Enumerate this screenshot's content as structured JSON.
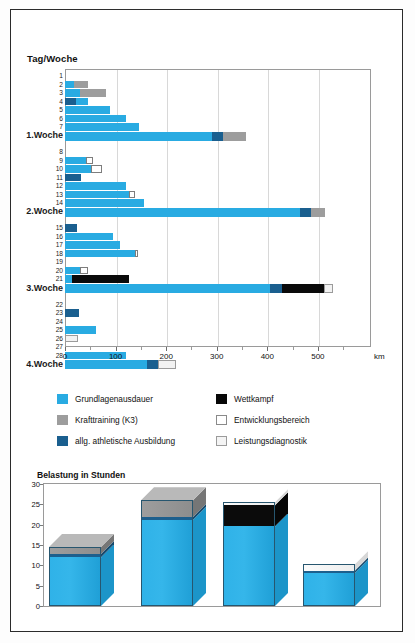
{
  "frame": {
    "border_color": "#2b2b2b"
  },
  "top_chart": {
    "title": "Tag/Woche",
    "unit_label": "km",
    "x_axis": {
      "min": 0,
      "max": 605,
      "ticks": [
        0,
        100,
        200,
        300,
        400,
        500
      ],
      "tick_labels": [
        "0",
        "100",
        "200",
        "300",
        "400",
        "500"
      ]
    },
    "colors": {
      "grundlagenausdauer": "#29abe2",
      "krafttraining": "#9d9d9d",
      "athletische_ausbildung": "#1a5f8f",
      "wettkampf": "#0a0a0a",
      "entwicklungsbereich": "#ffffff",
      "leistungsdiagnostik": "#f2f2f2"
    },
    "rows": [
      {
        "label": "1",
        "type": "day",
        "segments": []
      },
      {
        "label": "2",
        "type": "day",
        "segments": [
          {
            "k": "gla",
            "v": 18
          },
          {
            "k": "kraft",
            "v": 27
          }
        ]
      },
      {
        "label": "3",
        "type": "day",
        "segments": [
          {
            "k": "gla",
            "v": 30
          },
          {
            "k": "kraft",
            "v": 52
          }
        ]
      },
      {
        "label": "4",
        "type": "day",
        "segments": [
          {
            "k": "ath",
            "v": 22
          },
          {
            "k": "gla",
            "v": 24
          }
        ]
      },
      {
        "label": "5",
        "type": "day",
        "segments": [
          {
            "k": "gla",
            "v": 88
          }
        ]
      },
      {
        "label": "6",
        "type": "day",
        "segments": [
          {
            "k": "gla",
            "v": 120
          }
        ]
      },
      {
        "label": "7",
        "type": "day",
        "segments": [
          {
            "k": "gla",
            "v": 146
          }
        ]
      },
      {
        "label": "1.Woche",
        "type": "week",
        "segments": [
          {
            "k": "gla",
            "v": 290
          },
          {
            "k": "ath",
            "v": 22
          },
          {
            "k": "kraft",
            "v": 45
          }
        ]
      },
      {
        "label": "8",
        "type": "day",
        "segments": []
      },
      {
        "label": "9",
        "type": "day",
        "segments": [
          {
            "k": "gla",
            "v": 42
          },
          {
            "k": "entw",
            "v": 14
          }
        ]
      },
      {
        "label": "10",
        "type": "day",
        "segments": [
          {
            "k": "gla",
            "v": 52
          },
          {
            "k": "entw",
            "v": 22
          }
        ]
      },
      {
        "label": "11",
        "type": "day",
        "segments": [
          {
            "k": "ath",
            "v": 32
          }
        ]
      },
      {
        "label": "12",
        "type": "day",
        "segments": [
          {
            "k": "gla",
            "v": 120
          }
        ]
      },
      {
        "label": "13",
        "type": "day",
        "segments": [
          {
            "k": "gla",
            "v": 126
          },
          {
            "k": "entw",
            "v": 12
          }
        ]
      },
      {
        "label": "14",
        "type": "day",
        "segments": [
          {
            "k": "gla",
            "v": 157
          }
        ]
      },
      {
        "label": "2.Woche",
        "type": "week",
        "segments": [
          {
            "k": "gla",
            "v": 465
          },
          {
            "k": "ath",
            "v": 22
          },
          {
            "k": "kraft",
            "v": 27
          }
        ]
      },
      {
        "label": "15",
        "type": "day",
        "segments": [
          {
            "k": "ath",
            "v": 23
          }
        ]
      },
      {
        "label": "16",
        "type": "day",
        "segments": [
          {
            "k": "gla",
            "v": 95
          }
        ]
      },
      {
        "label": "17",
        "type": "day",
        "segments": [
          {
            "k": "gla",
            "v": 108
          }
        ]
      },
      {
        "label": "18",
        "type": "day",
        "segments": [
          {
            "k": "gla",
            "v": 138
          },
          {
            "k": "entw",
            "v": 7
          }
        ]
      },
      {
        "label": "19",
        "type": "day",
        "segments": []
      },
      {
        "label": "20",
        "type": "day",
        "segments": [
          {
            "k": "gla",
            "v": 30
          },
          {
            "k": "entw",
            "v": 16
          }
        ]
      },
      {
        "label": "21",
        "type": "day",
        "segments": [
          {
            "k": "gla",
            "v": 14
          },
          {
            "k": "wett",
            "v": 112
          }
        ]
      },
      {
        "label": "3.Woche",
        "type": "week",
        "segments": [
          {
            "k": "gla",
            "v": 406
          },
          {
            "k": "ath",
            "v": 24
          },
          {
            "k": "wett",
            "v": 82
          },
          {
            "k": "leist",
            "v": 17
          }
        ]
      },
      {
        "label": "22",
        "type": "day",
        "segments": []
      },
      {
        "label": "23",
        "type": "day",
        "segments": [
          {
            "k": "ath",
            "v": 28
          }
        ]
      },
      {
        "label": "24",
        "type": "day",
        "segments": []
      },
      {
        "label": "25",
        "type": "day",
        "segments": [
          {
            "k": "gla",
            "v": 62
          }
        ]
      },
      {
        "label": "26",
        "type": "day",
        "segments": [
          {
            "k": "leist",
            "v": 26
          }
        ]
      },
      {
        "label": "27",
        "type": "day",
        "segments": []
      },
      {
        "label": "28",
        "type": "day",
        "segments": [
          {
            "k": "gla",
            "v": 120
          }
        ]
      },
      {
        "label": "4.Woche",
        "type": "week",
        "segments": [
          {
            "k": "gla",
            "v": 162
          },
          {
            "k": "ath",
            "v": 22
          },
          {
            "k": "leist",
            "v": 35
          }
        ]
      }
    ],
    "chart_data": {
      "type": "bar",
      "orientation": "horizontal",
      "title": "Tag/Woche",
      "xlabel": "km",
      "ylabel": "Tag/Woche",
      "xlim": [
        0,
        605
      ],
      "grid": true,
      "categories": [
        "1",
        "2",
        "3",
        "4",
        "5",
        "6",
        "7",
        "1.Woche",
        "8",
        "9",
        "10",
        "11",
        "12",
        "13",
        "14",
        "2.Woche",
        "15",
        "16",
        "17",
        "18",
        "19",
        "20",
        "21",
        "3.Woche",
        "22",
        "23",
        "24",
        "25",
        "26",
        "27",
        "28",
        "4.Woche"
      ],
      "series": [
        {
          "name": "Grundlagenausdauer",
          "color": "#29abe2",
          "values": [
            0,
            18,
            30,
            24,
            88,
            120,
            146,
            290,
            0,
            42,
            52,
            0,
            120,
            126,
            157,
            465,
            0,
            95,
            108,
            138,
            0,
            30,
            14,
            406,
            0,
            0,
            0,
            62,
            0,
            0,
            120,
            162
          ]
        },
        {
          "name": "Krafttraining (K3)",
          "color": "#9d9d9d",
          "values": [
            0,
            27,
            52,
            0,
            0,
            0,
            0,
            45,
            0,
            0,
            0,
            0,
            0,
            0,
            0,
            27,
            0,
            0,
            0,
            0,
            0,
            0,
            0,
            0,
            0,
            0,
            0,
            0,
            0,
            0,
            0,
            0
          ]
        },
        {
          "name": "allg. athletische Ausbildung",
          "color": "#1a5f8f",
          "values": [
            0,
            0,
            0,
            22,
            0,
            0,
            0,
            22,
            0,
            0,
            0,
            32,
            0,
            0,
            0,
            22,
            23,
            0,
            0,
            0,
            0,
            0,
            0,
            24,
            0,
            28,
            0,
            0,
            0,
            0,
            0,
            22
          ]
        },
        {
          "name": "Wettkampf",
          "color": "#0a0a0a",
          "values": [
            0,
            0,
            0,
            0,
            0,
            0,
            0,
            0,
            0,
            0,
            0,
            0,
            0,
            0,
            0,
            0,
            0,
            0,
            0,
            0,
            0,
            0,
            112,
            82,
            0,
            0,
            0,
            0,
            0,
            0,
            0,
            0
          ]
        },
        {
          "name": "Entwicklungsbereich",
          "color": "#ffffff",
          "values": [
            0,
            0,
            0,
            0,
            0,
            0,
            0,
            0,
            0,
            14,
            22,
            0,
            0,
            12,
            0,
            0,
            0,
            0,
            0,
            7,
            0,
            16,
            0,
            0,
            0,
            0,
            0,
            0,
            0,
            0,
            0,
            0
          ]
        },
        {
          "name": "Leistungsdiagnostik",
          "color": "#f2f2f2",
          "values": [
            0,
            0,
            0,
            0,
            0,
            0,
            0,
            0,
            0,
            0,
            0,
            0,
            0,
            0,
            0,
            0,
            0,
            0,
            0,
            0,
            0,
            0,
            0,
            17,
            0,
            0,
            0,
            0,
            26,
            0,
            0,
            35
          ]
        }
      ]
    }
  },
  "legend": {
    "items": [
      {
        "label": "Grundlagenausdauer",
        "swatch": "sw-gla",
        "col": 0,
        "row": 0
      },
      {
        "label": "Krafttraining (K3)",
        "swatch": "sw-kraft",
        "col": 0,
        "row": 1
      },
      {
        "label": "allg. athletische Ausbildung",
        "swatch": "sw-ath",
        "col": 0,
        "row": 2
      },
      {
        "label": "Wettkampf",
        "swatch": "sw-wett",
        "col": 1,
        "row": 0
      },
      {
        "label": "Entwicklungsbereich",
        "swatch": "sw-entw",
        "col": 1,
        "row": 1
      },
      {
        "label": "Leistungsdiagnostik",
        "swatch": "sw-leist",
        "col": 1,
        "row": 2
      }
    ]
  },
  "bottom_chart": {
    "title": "Belastung in Stunden",
    "y_axis": {
      "min": 0,
      "max": 30,
      "ticks": [
        0,
        5,
        10,
        15,
        20,
        25,
        30
      ],
      "tick_labels": [
        "0",
        "5",
        "10",
        "15",
        "20",
        "25",
        "30"
      ]
    },
    "bars": [
      {
        "name": "1.Woche",
        "segments": [
          {
            "k": "gla",
            "v": 12.0
          },
          {
            "k": "ath",
            "v": 0.8
          },
          {
            "k": "kraft",
            "v": 1.7
          }
        ],
        "total": 14.5
      },
      {
        "name": "2.Woche",
        "segments": [
          {
            "k": "gla",
            "v": 21.2
          },
          {
            "k": "ath",
            "v": 0.7
          },
          {
            "k": "kraft",
            "v": 4.1
          }
        ],
        "total": 26.0
      },
      {
        "name": "3.Woche",
        "segments": [
          {
            "k": "gla",
            "v": 19.6
          },
          {
            "k": "wett",
            "v": 5.2
          },
          {
            "k": "leist",
            "v": 0.8
          }
        ],
        "total": 25.6
      },
      {
        "name": "4.Woche",
        "segments": [
          {
            "k": "gla",
            "v": 8.2
          },
          {
            "k": "ath",
            "v": 0.5
          },
          {
            "k": "leist",
            "v": 1.6
          }
        ],
        "total": 10.3
      }
    ],
    "chart_data": {
      "type": "bar",
      "title": "Belastung in Stunden",
      "xlabel": "",
      "ylabel": "Belastung in Stunden",
      "ylim": [
        0,
        30
      ],
      "grid": false,
      "style": "3d-stacked",
      "categories": [
        "1.Woche",
        "2.Woche",
        "3.Woche",
        "4.Woche"
      ],
      "series": [
        {
          "name": "Grundlagenausdauer",
          "color": "#29abe2",
          "values": [
            12.0,
            21.2,
            19.6,
            8.2
          ]
        },
        {
          "name": "allg. athletische Ausbildung",
          "color": "#1a5f8f",
          "values": [
            0.8,
            0.7,
            0.0,
            0.5
          ]
        },
        {
          "name": "Krafttraining (K3)",
          "color": "#9d9d9d",
          "values": [
            1.7,
            4.1,
            0.0,
            0.0
          ]
        },
        {
          "name": "Wettkampf",
          "color": "#0a0a0a",
          "values": [
            0.0,
            0.0,
            5.2,
            0.0
          ]
        },
        {
          "name": "Leistungsdiagnostik",
          "color": "#f2f2f2",
          "values": [
            0.0,
            0.0,
            0.8,
            1.6
          ]
        }
      ],
      "totals": [
        14.5,
        26.0,
        25.6,
        10.3
      ]
    }
  }
}
